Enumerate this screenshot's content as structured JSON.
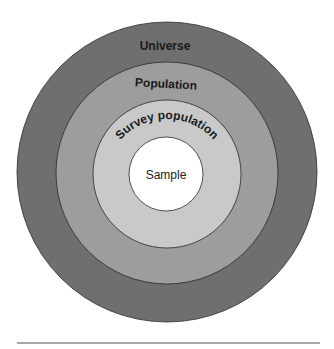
{
  "diagram": {
    "type": "concentric-circles",
    "center": [
      167,
      172
    ],
    "rings": [
      {
        "label": "Universe",
        "radius": 150,
        "fill": "#6f6f6f"
      },
      {
        "label": "Population",
        "radius": 111,
        "fill": "#9d9d9d"
      },
      {
        "label": "Survey population",
        "radius": 74,
        "fill": "#c9c9c9"
      },
      {
        "label": "Sample",
        "radius": 37,
        "fill": "#ffffff"
      }
    ],
    "stroke": "#2a2a2a"
  },
  "labels": {
    "universe": "Universe",
    "population": "Population",
    "survey_population": "Survey population",
    "sample": "Sample"
  },
  "footer_rule": {
    "color": "#555555"
  }
}
